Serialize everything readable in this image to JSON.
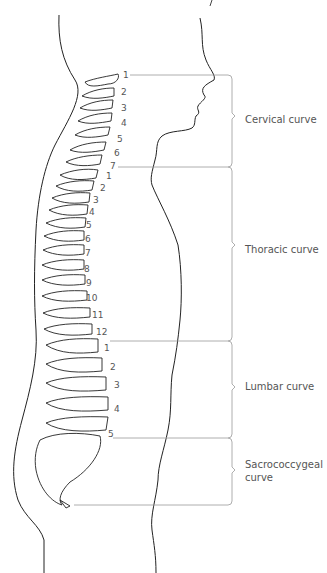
{
  "diagram": {
    "regions": [
      {
        "label": "Cervical curve",
        "vertebrae": [
          "1",
          "2",
          "3",
          "4",
          "5",
          "6",
          "7"
        ],
        "bracket_top": 75,
        "bracket_bottom": 167,
        "label_y": 114
      },
      {
        "label": "Thoracic curve",
        "vertebrae": [
          "1",
          "2",
          "3",
          "4",
          "5",
          "6",
          "7",
          "8",
          "9",
          "10",
          "11",
          "12"
        ],
        "bracket_top": 167,
        "bracket_bottom": 341,
        "label_y": 245
      },
      {
        "label": "Lumbar curve",
        "vertebrae": [
          "1",
          "2",
          "3",
          "4",
          "5"
        ],
        "bracket_top": 341,
        "bracket_bottom": 438,
        "label_y": 381
      },
      {
        "label_line1": "Sacrococcygeal",
        "label_line2": "curve",
        "vertebrae": [],
        "bracket_top": 438,
        "bracket_bottom": 505,
        "label_y": 460
      }
    ],
    "colors": {
      "outline": "#222222",
      "bracket": "#999999",
      "text": "#555555"
    }
  }
}
